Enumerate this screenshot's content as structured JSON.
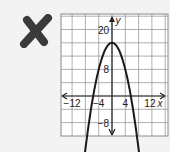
{
  "mark": {
    "symbol": "X",
    "color": "#3a3a3a",
    "meaning": "incorrect"
  },
  "chart_data": {
    "type": "line",
    "title": "",
    "xlabel": "x",
    "ylabel": "y",
    "xlim": [
      -15,
      16
    ],
    "ylim": [
      -12,
      24
    ],
    "grid": true,
    "grid_step": 4,
    "x_tick_labels": [
      "-12",
      "-4",
      "4",
      "12"
    ],
    "y_tick_labels": [
      "20",
      "8",
      "-8"
    ],
    "series": [
      {
        "name": "parabola",
        "equation": "y = -0.5x^2 + 16 (approx)",
        "vertex": [
          0,
          16
        ],
        "x_intercepts": [
          -5.7,
          5.7
        ],
        "color": "#1a1a1a"
      }
    ]
  }
}
